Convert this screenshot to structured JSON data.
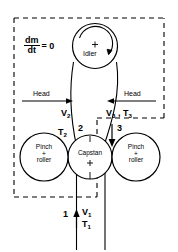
{
  "figure": {
    "type": "engineering-diagram",
    "background_color": "#ffffff",
    "line_color": "#000000",
    "control_volume": {
      "style": "dashed",
      "label_equation_numerator": "dm",
      "label_equation_denominator": "dt",
      "label_equation_rhs": "= 0"
    },
    "components": [
      {
        "id": "idler",
        "label_line1": "Idler",
        "label_line2": "",
        "center_marker": "+",
        "rotation_arrow": "clockwise-arc"
      },
      {
        "id": "pinch-left",
        "label_line1": "Pinch",
        "label_line2": "+",
        "label_line3": "roller",
        "center_marker": ""
      },
      {
        "id": "capstan",
        "label_line1": "Capstan",
        "label_line2": "",
        "center_marker": "+"
      },
      {
        "id": "pinch-right",
        "label_line1": "Pinch",
        "label_line2": "+",
        "label_line3": "roller",
        "center_marker": ""
      }
    ],
    "heads": [
      {
        "id": "head-left",
        "label": "Head",
        "arrow_direction": "right"
      },
      {
        "id": "head-right",
        "label": "Head",
        "arrow_direction": "left"
      }
    ],
    "stations": [
      {
        "number": "1",
        "velocity": "V",
        "velocity_sub": "1",
        "tension": "T",
        "tension_sub": "1",
        "arrow_direction": "up"
      },
      {
        "number": "2",
        "velocity": "V",
        "velocity_sub": "2",
        "tension": "T",
        "tension_sub": "2",
        "arrow_direction": "up"
      },
      {
        "number": "3",
        "velocity": "V",
        "velocity_sub": "3",
        "tension": "T",
        "tension_sub": "3",
        "arrow_direction": "down"
      }
    ],
    "annotations": {
      "v1": "V",
      "v1_sub": "1",
      "t1": "T",
      "t1_sub": "1",
      "v2": "V",
      "v2_sub": "2",
      "t2": "T",
      "t2_sub": "2",
      "v3_t3_v": "V",
      "v3_t3_vsub": "3",
      "v3_t3_sep": " ,",
      "v3_t3_t": "T",
      "v3_t3_tsub": "3",
      "num1": "1",
      "num2": "2",
      "num3": "3"
    }
  }
}
